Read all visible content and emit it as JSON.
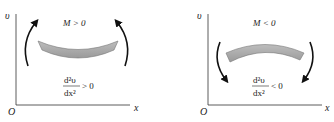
{
  "panels": [
    {
      "id": "positive",
      "y_axis_label": "υ",
      "x_axis_label": "x",
      "origin_label": "O",
      "moment_condition": "M > 0",
      "curvature": {
        "numerator": "d²υ",
        "denominator": "dx²",
        "relation": "> 0"
      },
      "beam_shape": "concave-up",
      "arrow_direction": "up"
    },
    {
      "id": "negative",
      "y_axis_label": "υ",
      "x_axis_label": "x",
      "origin_label": "O",
      "moment_condition": "M < 0",
      "curvature": {
        "numerator": "d²υ",
        "denominator": "dx²",
        "relation": "< 0"
      },
      "beam_shape": "concave-down",
      "arrow_direction": "down"
    }
  ],
  "colors": {
    "axis": "#333333",
    "beam_fill": "#a8a8a8",
    "beam_stroke": "#777777",
    "arrow": "#111111"
  }
}
